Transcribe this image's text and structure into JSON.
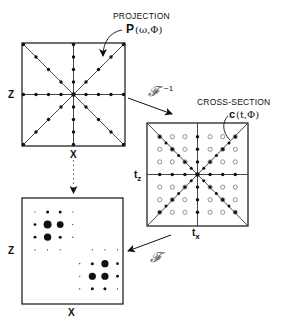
{
  "diagram": {
    "projection_panel": {
      "title": "PROJECTION",
      "function_label": "P",
      "function_args": "(ω,Φ)",
      "x_axis_label": "x",
      "y_axis_label": "z",
      "rays": 8,
      "dots_per_half_ray": 4
    },
    "cross_section_panel": {
      "title": "CROSS-SECTION",
      "function_label": "c",
      "function_args": "(t,Φ)",
      "x_axis_label": "t",
      "x_axis_sub": "x",
      "y_axis_label": "t",
      "y_axis_sub": "z",
      "grid_size": 7,
      "filled_marker": "on-ray samples",
      "open_marker": "grid points"
    },
    "object_panel": {
      "x_axis_label": "x",
      "y_axis_label": "z",
      "grid_size": 8
    },
    "transforms": {
      "inverse_fourier": "𝓕",
      "inverse_exponent": "−1",
      "forward_fourier": "𝓕"
    },
    "colors": {
      "ink": "#111111",
      "script": "#6a6a6a",
      "background": "#ffffff"
    }
  }
}
